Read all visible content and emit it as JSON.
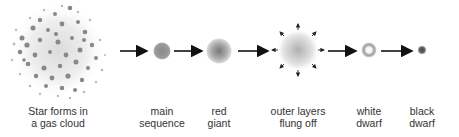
{
  "stages": [
    {
      "id": "gas-cloud",
      "label_line1": "Star forms in",
      "label_line2": "a gas cloud"
    },
    {
      "id": "main-sequence",
      "label_line1": "main",
      "label_line2": "sequence"
    },
    {
      "id": "red-giant",
      "label_line1": "red",
      "label_line2": "giant"
    },
    {
      "id": "outer-layers",
      "label_line1": "outer layers",
      "label_line2": "flung off"
    },
    {
      "id": "white-dwarf",
      "label_line1": "white",
      "label_line2": "dwarf"
    },
    {
      "id": "black-dwarf",
      "label_line1": "black",
      "label_line2": "dwarf"
    }
  ],
  "colors": {
    "arrow": "#111111",
    "text": "#333333",
    "star_gray": "#888888"
  }
}
